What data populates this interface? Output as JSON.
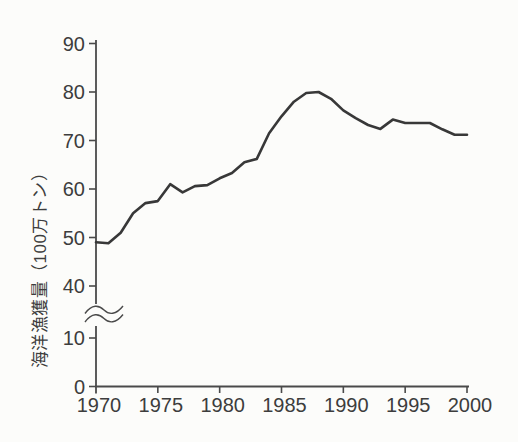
{
  "page": {
    "background": "#fcfcfa"
  },
  "chart_data": {
    "type": "line",
    "title": "",
    "xlabel": "",
    "ylabel": "海洋漁獲量（100万トン）",
    "x": [
      1970,
      1971,
      1972,
      1973,
      1974,
      1975,
      1976,
      1977,
      1978,
      1979,
      1980,
      1981,
      1982,
      1983,
      1984,
      1985,
      1986,
      1987,
      1988,
      1989,
      1990,
      1991,
      1992,
      1993,
      1994,
      1995,
      1996,
      1997,
      1998,
      1999,
      2000
    ],
    "series": [
      {
        "name": "海洋漁獲量",
        "values": [
          49,
          48.8,
          51,
          55,
          57.1,
          57.5,
          61,
          59.3,
          60.6,
          60.8,
          62.2,
          63.3,
          65.5,
          66.2,
          71.5,
          75,
          78,
          79.8,
          80,
          78.6,
          76.2,
          74.6,
          73.2,
          72.4,
          74.3,
          73.6,
          73.6,
          73.6,
          72.3,
          71.2,
          71.2
        ]
      }
    ],
    "x_ticks": [
      "1970",
      "1975",
      "1980",
      "1985",
      "1990",
      "1995",
      "2000"
    ],
    "y_ticks_upper": [
      90,
      80,
      70,
      60,
      50,
      40
    ],
    "y_ticks_lower": [
      10,
      0
    ],
    "y_axis_break": true,
    "ylim_upper": [
      40,
      90
    ],
    "ylim_lower": [
      0,
      10
    ],
    "xlim": [
      1970,
      2000
    ],
    "grid": false,
    "legend": "none",
    "line_color": "#383838",
    "axis_color": "#4a4a4a",
    "text_color": "#3d3d3d"
  }
}
